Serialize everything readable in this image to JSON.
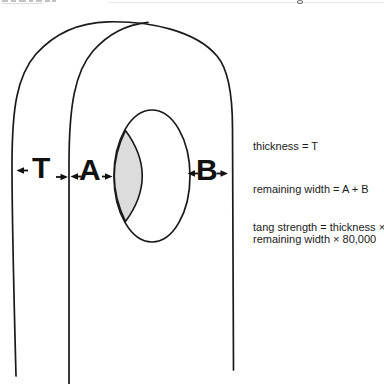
{
  "page": {
    "background": "#ffffff"
  },
  "diagram": {
    "labels": {
      "thickness": "T",
      "width_a": "A",
      "width_b": "B"
    },
    "formulas": {
      "thickness": "thickness = T",
      "remaining_width": "remaining width = A + B",
      "tang_strength_line1": "tang strength = thickness ×",
      "tang_strength_line2": "remaining width × 80,000"
    },
    "colors": {
      "line": "#1a1a1a",
      "hole_shading": "#dcdcdc",
      "label_text": "#111111",
      "formula_text": "#1a1a1a"
    }
  }
}
